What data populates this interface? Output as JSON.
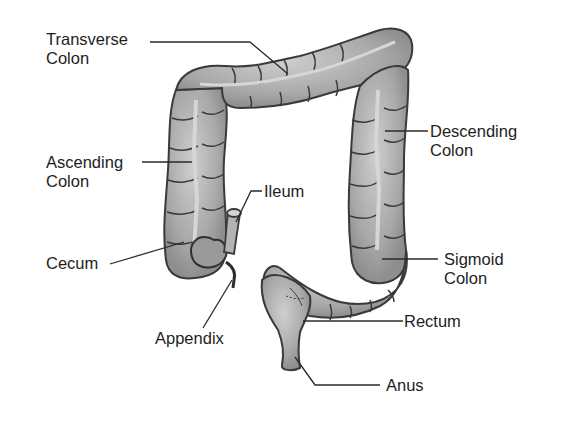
{
  "diagram": {
    "colors": {
      "organ_fill": "#a9a9a9",
      "organ_light": "#c8c8c8",
      "organ_outline": "#3a3a3a",
      "leader_line": "#2a2a2a",
      "text": "#1e1e1e",
      "background": "#ffffff"
    },
    "labels": {
      "transverse_colon": {
        "line1": "Transverse",
        "line2": "Colon"
      },
      "ascending_colon": {
        "line1": "Ascending",
        "line2": "Colon"
      },
      "descending_colon": {
        "line1": "Descending",
        "line2": "Colon"
      },
      "ileum": {
        "line1": "Ileum"
      },
      "cecum": {
        "line1": "Cecum"
      },
      "sigmoid_colon": {
        "line1": "Sigmoid",
        "line2": "Colon"
      },
      "appendix": {
        "line1": "Appendix"
      },
      "rectum": {
        "line1": "Rectum"
      },
      "anus": {
        "line1": "Anus"
      }
    }
  }
}
